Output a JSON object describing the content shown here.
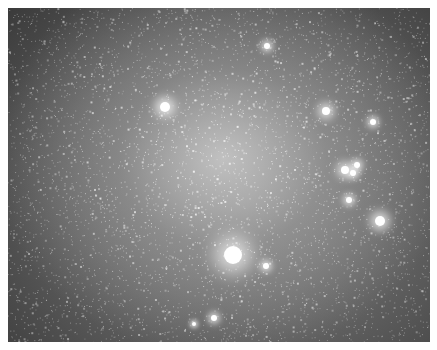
{
  "image": {
    "subject": "star field / galaxy photograph",
    "border_color": "#ffffff",
    "bright_stars": [
      {
        "x": 157,
        "y": 99,
        "r": 5
      },
      {
        "x": 225,
        "y": 247,
        "r": 9
      },
      {
        "x": 318,
        "y": 103,
        "r": 4
      },
      {
        "x": 372,
        "y": 213,
        "r": 5
      },
      {
        "x": 337,
        "y": 162,
        "r": 4
      },
      {
        "x": 345,
        "y": 165,
        "r": 3
      },
      {
        "x": 349,
        "y": 157,
        "r": 3
      },
      {
        "x": 341,
        "y": 192,
        "r": 3
      },
      {
        "x": 365,
        "y": 114,
        "r": 3
      },
      {
        "x": 259,
        "y": 38,
        "r": 3
      },
      {
        "x": 258,
        "y": 258,
        "r": 3
      },
      {
        "x": 206,
        "y": 310,
        "r": 3
      },
      {
        "x": 186,
        "y": 316,
        "r": 2
      }
    ]
  }
}
